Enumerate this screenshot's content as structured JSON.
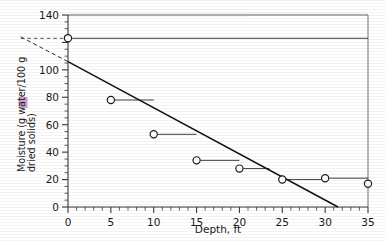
{
  "chart_data": {
    "type": "scatter",
    "title": "",
    "xlabel": "Depth, ft",
    "ylabel_line1": "Moisture (g water/100 g",
    "ylabel_line2": "dried solids)",
    "ylabel": "Moisture (g water/100 g dried solids)",
    "xlim": [
      0,
      35
    ],
    "ylim": [
      0,
      140
    ],
    "x_ticks": [
      0,
      5,
      10,
      15,
      20,
      25,
      30,
      35
    ],
    "x_tick_labels": [
      "0",
      "5",
      "10",
      "15",
      "20",
      "25",
      "30",
      "35"
    ],
    "x_minor_step": 1,
    "y_ticks": [
      0,
      20,
      40,
      60,
      80,
      100,
      120,
      140
    ],
    "y_tick_labels": [
      "0",
      "20",
      "40",
      "60",
      "80",
      "100",
      "",
      "140"
    ],
    "y_minor_step": 5,
    "grid": false,
    "legend": "none",
    "x": [
      0,
      5,
      10,
      15,
      20,
      25,
      30,
      35
    ],
    "values": [
      123,
      78,
      53,
      34,
      28,
      20,
      21,
      17
    ],
    "points": [
      {
        "depth": 0,
        "moisture": 123,
        "whisker_to": 35
      },
      {
        "depth": 5,
        "moisture": 78,
        "whisker_to": 10
      },
      {
        "depth": 10,
        "moisture": 53,
        "whisker_to": 15
      },
      {
        "depth": 15,
        "moisture": 34,
        "whisker_to": 20
      },
      {
        "depth": 20,
        "moisture": 28,
        "whisker_to": 23.5
      },
      {
        "depth": 25,
        "moisture": 20,
        "whisker_to": 30
      },
      {
        "depth": 30,
        "moisture": 21,
        "whisker_to": 35
      },
      {
        "depth": 35,
        "moisture": 17,
        "whisker_to": 35
      }
    ],
    "fit_line": {
      "label": "regression-line",
      "x_start": 0,
      "y_start": 106,
      "x_end": 31.5,
      "y_end": 0
    },
    "extrapolation_dashed": {
      "label": "extrapolated-fit",
      "x_start": -5.5,
      "y_start": 124,
      "x_end": 0,
      "y_end": 106
    },
    "intercept_guide": {
      "label": "intercept-guide",
      "x_start": -5.5,
      "y": 123,
      "x_end": 0
    },
    "annotations": [],
    "colors": {
      "marker_edge": "#1d1d1d",
      "marker_fill": "#ffffff",
      "fit_line": "#141414",
      "axis": "#3a3a3a",
      "frame": "#6f6f6f",
      "text": "#1a1a1a",
      "highlight": "#a24ea2"
    }
  }
}
